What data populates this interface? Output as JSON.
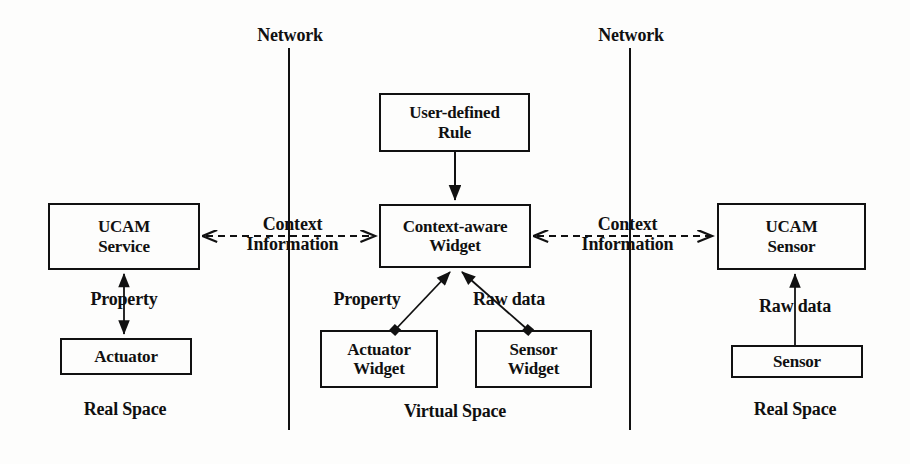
{
  "figure": {
    "stroke_color": "#111111",
    "background_color": "#fdfdfc"
  },
  "boundaries": [
    {
      "name": "network-boundary-left",
      "label": "Network"
    },
    {
      "name": "network-boundary-right",
      "label": "Network"
    }
  ],
  "zones": [
    {
      "name": "zone-real-space-left",
      "label": "Real Space"
    },
    {
      "name": "zone-virtual-space",
      "label": "Virtual Space"
    },
    {
      "name": "zone-real-space-right",
      "label": "Real Space"
    }
  ],
  "nodes": {
    "ucam_service": "UCAM\nService",
    "actuator": "Actuator",
    "user_defined_rule": "User-defined\nRule",
    "context_aware_widget": "Context-aware\nWidget",
    "actuator_widget": "Actuator\nWidget",
    "sensor_widget": "Sensor\nWidget",
    "ucam_sensor": "UCAM\nSensor",
    "sensor": "Sensor"
  },
  "edges": {
    "left_context_information": "Context\nInformation",
    "right_context_information": "Context\nInformation",
    "left_property": "Property",
    "widget_property": "Property",
    "widget_raw_data": "Raw data",
    "right_raw_data": "Raw data"
  }
}
